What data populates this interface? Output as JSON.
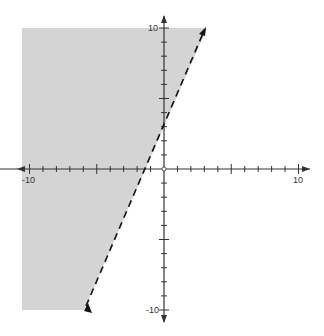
{
  "chart_data": {
    "type": "line",
    "title": "",
    "inequality": "y > 2x + 3",
    "boundary": {
      "slope": 2,
      "intercept": 3,
      "style": "dashed"
    },
    "shaded_side": "left/above",
    "xlim": [
      -10,
      10
    ],
    "ylim": [
      -10,
      10
    ],
    "x_tick_labels": [
      "-10",
      "10"
    ],
    "y_tick_labels": [
      "10",
      "-10"
    ],
    "grid": false,
    "colors": {
      "shade": "#d4d4d4",
      "axis": "#333333",
      "line": "#111111"
    }
  },
  "labels": {
    "x_min": "-10",
    "x_max": "10",
    "y_max": "10",
    "y_min": "-10"
  }
}
